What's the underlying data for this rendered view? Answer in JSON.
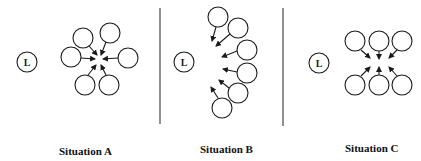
{
  "panels": [
    {
      "id": "A",
      "label": "Situation A",
      "leader_label": "L"
    },
    {
      "id": "B",
      "label": "Situation B",
      "leader_label": "L"
    },
    {
      "id": "C",
      "label": "Situation C",
      "leader_label": "L"
    }
  ],
  "colors": {
    "stroke": "#1a1a1a",
    "background": "#ffffff"
  }
}
